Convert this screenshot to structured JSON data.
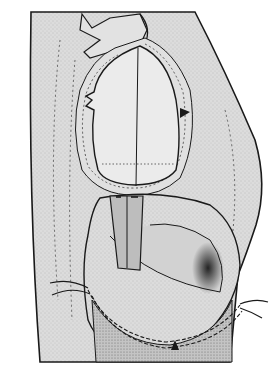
{
  "image": {
    "kind": "technical sewing illustration",
    "subject": "garment panel with oval opening and attached pocket bag being stitched",
    "alt": "Line drawing of a fabric panel with a stitched oval opening at top and a rounded pocket bag below, with thread ends at the sides",
    "colors": {
      "background": "#ffffff",
      "fabric": "#d9d9d9",
      "fabric_light": "#e6e6e6",
      "pocket_facing": "#bdbdbd",
      "ink": "#1a1a1a",
      "shadow": "#2b2b2b"
    }
  }
}
